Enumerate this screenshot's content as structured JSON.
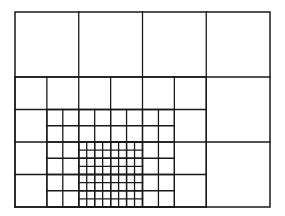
{
  "diagram": {
    "type": "quadtree-mesh-refinement",
    "stroke_color": "#1a1a1a",
    "background": "#ffffff",
    "origin_px": [
      15,
      12
    ],
    "size_px": [
      255,
      195
    ],
    "units": [
      32,
      24
    ],
    "levels": [
      {
        "level": 0,
        "cell_units": 8,
        "region": [
          0,
          0,
          32,
          24
        ]
      },
      {
        "level": 1,
        "cell_units": 4,
        "region": [
          0,
          8,
          24,
          24
        ]
      },
      {
        "level": 2,
        "cell_units": 2,
        "region": [
          4,
          12,
          20,
          24
        ]
      },
      {
        "level": 3,
        "cell_units": 1,
        "region": [
          8,
          16,
          16,
          24
        ]
      }
    ],
    "level0_lines": [
      [
        8,
        0,
        8,
        8
      ],
      [
        16,
        0,
        16,
        8
      ],
      [
        24,
        0,
        24,
        24
      ],
      [
        0,
        8,
        32,
        8
      ],
      [
        24,
        16,
        32,
        16
      ]
    ]
  }
}
